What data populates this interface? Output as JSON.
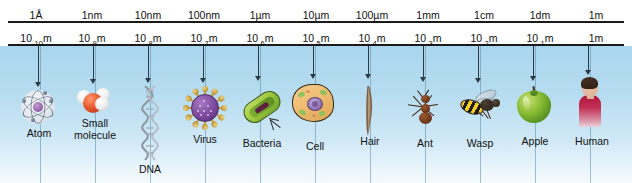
{
  "figure": {
    "background_top_color": "#a9d6ee",
    "background_bottom_color": "#f4fafd"
  },
  "ruler": {
    "units": [
      "1Å",
      "1nm",
      "10nm",
      "100nm",
      "1µm",
      "10µm",
      "100µm",
      "1mm",
      "1cm",
      "1dm",
      "1m"
    ],
    "exponents": [
      {
        "mantissa": "10",
        "exponent": "-10",
        "unit": "m"
      },
      {
        "mantissa": "10",
        "exponent": "-9",
        "unit": "m"
      },
      {
        "mantissa": "10",
        "exponent": "-8",
        "unit": "m"
      },
      {
        "mantissa": "10",
        "exponent": "-7",
        "unit": "m"
      },
      {
        "mantissa": "10",
        "exponent": "-6",
        "unit": "m"
      },
      {
        "mantissa": "10",
        "exponent": "-5",
        "unit": "m"
      },
      {
        "mantissa": "10",
        "exponent": "-4",
        "unit": "m"
      },
      {
        "mantissa": "10",
        "exponent": "-3",
        "unit": "m"
      },
      {
        "mantissa": "10",
        "exponent": "-2",
        "unit": "m"
      },
      {
        "mantissa": "10",
        "exponent": "-1",
        "unit": "m"
      },
      {
        "mantissa": "1",
        "exponent": "",
        "unit": "m"
      }
    ]
  },
  "objects": [
    {
      "label": "Atom",
      "icon": "atom-icon",
      "scale": "1Å",
      "exponent": "10-10 m"
    },
    {
      "label": "Small\nmolecule",
      "icon": "molecule-icon",
      "scale": "1nm",
      "exponent": "10-9 m"
    },
    {
      "label": "DNA",
      "icon": "dna-helix-icon",
      "scale": "10nm",
      "exponent": "10-8 m"
    },
    {
      "label": "Virus",
      "icon": "virus-icon",
      "scale": "100nm",
      "exponent": "10-7 m"
    },
    {
      "label": "Bacteria",
      "icon": "bacteria-icon",
      "scale": "1µm",
      "exponent": "10-6 m"
    },
    {
      "label": "Cell",
      "icon": "animal-cell-icon",
      "scale": "10µm",
      "exponent": "10-5 m"
    },
    {
      "label": "Hair",
      "icon": "hair-strand-icon",
      "scale": "100µm",
      "exponent": "10-4 m"
    },
    {
      "label": "Ant",
      "icon": "ant-icon",
      "scale": "1mm",
      "exponent": "10-3 m"
    },
    {
      "label": "Wasp",
      "icon": "wasp-icon",
      "scale": "1cm",
      "exponent": "10-2 m"
    },
    {
      "label": "Apple",
      "icon": "apple-icon",
      "scale": "1dm",
      "exponent": "10-1 m"
    },
    {
      "label": "Human",
      "icon": "human-figure-icon",
      "scale": "1m",
      "exponent": "1 m"
    }
  ]
}
